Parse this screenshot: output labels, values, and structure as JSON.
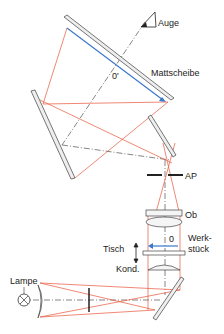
{
  "labels": {
    "auge": "Auge",
    "mattscheibe": "Mattscheibe",
    "zero_prime": "0'",
    "ap": "AP",
    "ob": "Ob",
    "zero": "0",
    "werk1": "Werk-",
    "werk2": "stück",
    "tisch": "Tisch",
    "kond": "Kond.",
    "lampe": "Lampe"
  },
  "colors": {
    "ray": "#e8553a",
    "image_arrow": "#3a78c8",
    "mirror": "#555555",
    "axis": "#333333"
  }
}
